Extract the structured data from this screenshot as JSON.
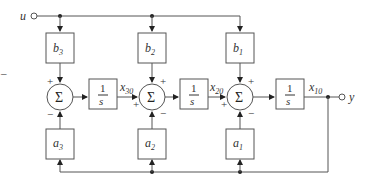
{
  "diagram": {
    "input_label": "u",
    "output_label": "y",
    "b_blocks": [
      {
        "name": "b",
        "sub": "3"
      },
      {
        "name": "b",
        "sub": "2"
      },
      {
        "name": "b",
        "sub": "1"
      }
    ],
    "a_blocks": [
      {
        "name": "a",
        "sub": "3"
      },
      {
        "name": "a",
        "sub": "2"
      },
      {
        "name": "a",
        "sub": "1"
      }
    ],
    "summers": [
      {
        "symbol": "Σ",
        "top_sign": "+",
        "left_sign": "",
        "bottom_sign": "−"
      },
      {
        "symbol": "Σ",
        "top_sign": "+",
        "left_sign": "+",
        "bottom_sign": "−"
      },
      {
        "symbol": "Σ",
        "top_sign": "+",
        "left_sign": "+",
        "bottom_sign": "−"
      }
    ],
    "integrators": [
      {
        "num": "1",
        "den": "s"
      },
      {
        "num": "1",
        "den": "s"
      },
      {
        "num": "1",
        "den": "s"
      }
    ],
    "states": [
      {
        "name": "x",
        "sub": "30"
      },
      {
        "name": "x",
        "sub": "20"
      },
      {
        "name": "x",
        "sub": "10"
      }
    ],
    "stray_mark": "–",
    "line_color": "#555555"
  }
}
